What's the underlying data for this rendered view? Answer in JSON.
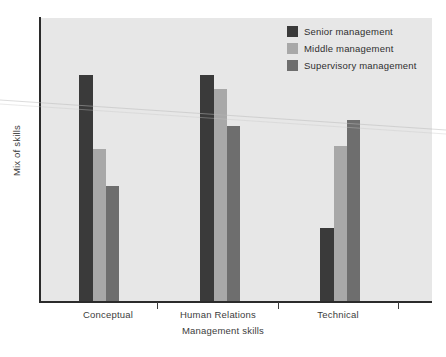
{
  "chart_data": {
    "type": "bar",
    "title": "",
    "subtitle": "",
    "xlabel": "Management skills",
    "ylabel": "Mix of skills",
    "categories": [
      "Conceptual",
      "Human Relations",
      "Technical"
    ],
    "series": [
      {
        "name": "Senior management",
        "color": "#3a3a3a",
        "values": [
          80,
          80,
          26
        ]
      },
      {
        "name": "Middle management",
        "color": "#a8a8a8",
        "values": [
          54,
          75,
          55
        ]
      },
      {
        "name": "Supervisory management",
        "color": "#6e6e6e",
        "values": [
          41,
          62,
          64
        ]
      }
    ],
    "ylim": [
      0,
      100
    ],
    "y_tick_labels": [],
    "x_tick_labels": [
      "Conceptual",
      "Human Relations",
      "Technical"
    ],
    "grid": false,
    "legend_position": "top-right",
    "plot_background": "#e7e7e7",
    "axis_color": "#2b2b2b",
    "annotations": []
  },
  "legend": {
    "items": [
      {
        "label": "Senior management",
        "swatch": "legend-swatch-senior"
      },
      {
        "label": "Middle management",
        "swatch": "legend-swatch-middle"
      },
      {
        "label": "Supervisory management",
        "swatch": "legend-swatch-supervisory"
      }
    ]
  },
  "axes": {
    "x_title": "Management skills",
    "y_title": "Mix of skills",
    "x_categories": [
      "Conceptual",
      "Human Relations",
      "Technical"
    ]
  }
}
